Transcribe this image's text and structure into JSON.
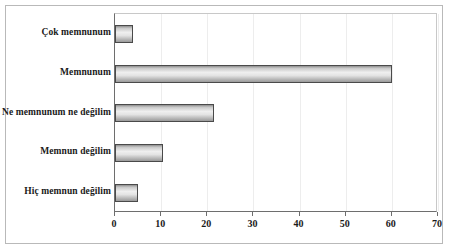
{
  "chart_data": {
    "type": "bar",
    "orientation": "horizontal",
    "title": "",
    "xlabel": "",
    "ylabel": "",
    "categories": [
      "Çok memnunum",
      "Memnunum",
      "Ne memnunum ne değilim",
      "Memnun değilim",
      "Hiç memnun değilim"
    ],
    "values": [
      4,
      60,
      21.5,
      10.5,
      5
    ],
    "xlim": [
      0,
      70
    ],
    "xticks": [
      0,
      10,
      20,
      30,
      40,
      50,
      60,
      70
    ],
    "xtick_labels": [
      "0",
      "10",
      "20",
      "30",
      "40",
      "50",
      "60",
      "70"
    ],
    "grid": false,
    "legend": null,
    "bar_fill_light": "#efefef",
    "bar_fill_dark": "#8d8d8d",
    "bar_border_color": "#4a4a4a",
    "axis_color": "#6e6e6e",
    "frame_color": "#b9b9b9",
    "text_color": "#1a1a1a",
    "background": "#ffffff"
  }
}
